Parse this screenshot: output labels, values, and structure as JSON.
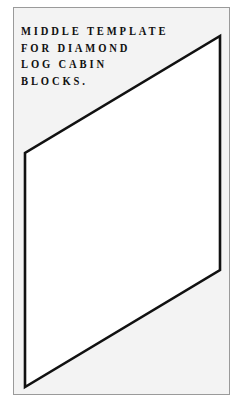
{
  "document": {
    "title_lines": [
      "MIDDLE TEMPLATE",
      "FOR DIAMOND",
      "LOG CABIN",
      "BLOCKS."
    ]
  },
  "template_shape": {
    "type": "parallelogram",
    "points": "220,36 220,270 25,387 25,153",
    "stroke": "#111111",
    "fill": "#ffffff"
  },
  "colors": {
    "sheet_background": "#f3f3f3",
    "sheet_border": "#9a9a9a",
    "text": "#111111"
  }
}
